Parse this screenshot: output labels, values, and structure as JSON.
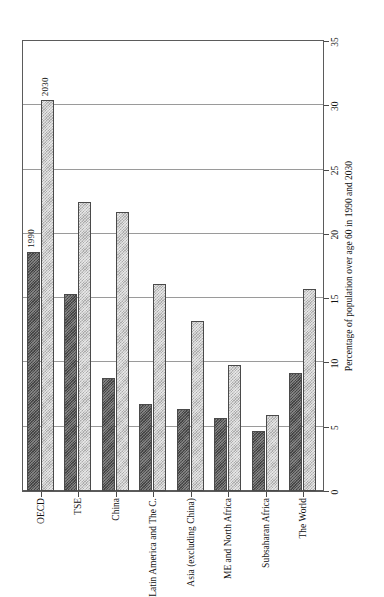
{
  "figure": {
    "background_color": "#ffffff",
    "orientation": "rotated-90-horizontal-bars",
    "frame_color": "#5b5b5b"
  },
  "annotations": {
    "series_1990_label": "1990",
    "series_2030_label": "2030"
  },
  "axis": {
    "value_axis_title": "Percentage of population over age 60 in 1990 and 2030",
    "value_ticks": [
      "0",
      "5",
      "10",
      "15",
      "20",
      "25",
      "30",
      "35"
    ]
  },
  "colors": {
    "series_1990": "#555555",
    "series_2030": "#c8c8c8",
    "gridline": "#9a9a9a",
    "axis": "#4a4a4a"
  },
  "chart_data": {
    "type": "bar",
    "title": "",
    "subtitle": "",
    "orientation": "horizontal",
    "xlabel": "Percentage of population over age 60 in 1990 and 2030",
    "ylabel": "",
    "xlim": [
      0,
      35
    ],
    "xticks": [
      0,
      5,
      10,
      15,
      20,
      25,
      30,
      35
    ],
    "grid": true,
    "legend": "in-plot annotations labelling first group bars",
    "categories": [
      "OECD",
      "TSE",
      "China",
      "Latin America and The C.",
      "Asia (excluding China)",
      "ME and North Africa",
      "Subsaharan Africa",
      "The World"
    ],
    "series": [
      {
        "name": "1990",
        "color": "#555555",
        "values": [
          18.6,
          15.3,
          8.8,
          6.8,
          6.4,
          5.7,
          4.7,
          9.2
        ]
      },
      {
        "name": "2030",
        "color": "#c8c8c8",
        "values": [
          30.4,
          22.5,
          21.7,
          16.1,
          13.2,
          9.8,
          5.9,
          15.7
        ]
      }
    ]
  }
}
